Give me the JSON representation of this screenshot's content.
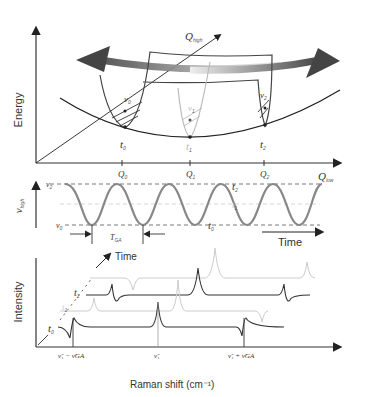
{
  "panel_a": {
    "y_label": "Energy",
    "axis_high": "Q",
    "axis_high_sub": "high",
    "axis_low": "Q",
    "axis_low_sub": "low",
    "ticks": [
      {
        "label": "Q",
        "sub": "0"
      },
      {
        "label": "Q",
        "sub": "1"
      },
      {
        "label": "Q",
        "sub": "2"
      }
    ],
    "times": [
      {
        "label": "t",
        "sub": "0"
      },
      {
        "label": "t",
        "sub": "1"
      },
      {
        "label": "t",
        "sub": "2"
      }
    ],
    "freqs": [
      {
        "label": "ν",
        "sub": "0"
      },
      {
        "label": "ν",
        "sub": "1"
      },
      {
        "label": "ν",
        "sub": "2"
      }
    ]
  },
  "panel_b": {
    "y_label": "ν",
    "y_label_sub": "high",
    "levels": [
      {
        "label": "ν",
        "sub": "2",
        "time": "t",
        "time_sub": "2"
      },
      {
        "label": "ν",
        "sub": "1",
        "time": "t",
        "time_sub": "1"
      },
      {
        "label": "ν",
        "sub": "0",
        "time": "t",
        "time_sub": "0"
      }
    ],
    "period_label": "T",
    "period_sub": "GA",
    "x_label": "Time"
  },
  "panel_c": {
    "y_label": "Intensity",
    "time_label": "Time",
    "traces": [
      {
        "label": "t",
        "sub": "0"
      },
      {
        "label": "t",
        "sub": "1"
      },
      {
        "label": "t",
        "sub": "2"
      }
    ],
    "x_ticks": [
      "ν̃₁ − ν̃GA",
      "ν̃₁",
      "ν̃₁ + ν̃GA"
    ],
    "x_label": "Raman shift (cm⁻¹)"
  }
}
